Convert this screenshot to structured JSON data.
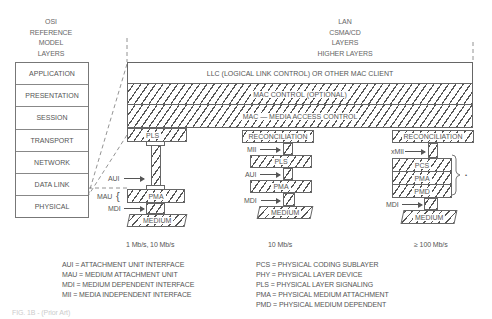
{
  "osi_header": [
    "OSI",
    "REFERENCE",
    "MODEL",
    "LAYERS"
  ],
  "lan_header": [
    "LAN",
    "CSMA/CD",
    "LAYERS",
    "HIGHER LAYERS"
  ],
  "osi_layers": [
    "APPLICATION",
    "PRESENTATION",
    "SESSION",
    "TRANSPORT",
    "NETWORK",
    "DATA LINK",
    "PHYSICAL"
  ],
  "lan_layers": {
    "llc": "LLC (LOGICAL LINK CONTROL) OR OTHER MAC CLIENT",
    "mac_control": "MAC CONTROL (OPTIONAL)",
    "mac": "MAC — MEDIA ACCESS CONTROL"
  },
  "stacks": [
    {
      "top": "PLS",
      "interfaces": {
        "aui": "AUI",
        "mau": "MAU",
        "mdi": "MDI"
      },
      "pma": "PMA",
      "medium": "MEDIUM",
      "speed": "1 Mb/s, 10 Mb/s"
    },
    {
      "top": "RECONCILIATION",
      "interfaces": {
        "mii": "MII",
        "aui": "AUI",
        "mdi": "MDI"
      },
      "pls": "PLS",
      "pma": "PMA",
      "medium": "MEDIUM",
      "speed": "10 Mb/s"
    },
    {
      "top": "RECONCILIATION",
      "interfaces": {
        "xmii": "xMII",
        "mdi": "MDI"
      },
      "pcs": "PCS",
      "pma": "PMA",
      "pmd": "PMD",
      "medium": "MEDIUM",
      "speed": "≥ 100 Mb/s",
      "brace_label": "PHY"
    }
  ],
  "legend_left": [
    "AUI = ATTACHMENT UNIT INTERFACE",
    "MAU = MEDIUM ATTACHMENT UNIT",
    "MDI = MEDIUM DEPENDENT INTERFACE",
    "MII = MEDIA INDEPENDENT INTERFACE"
  ],
  "legend_right": [
    "PCS = PHYSICAL CODING SUBLAYER",
    "PHY = PHYSICAL LAYER DEVICE",
    "PLS = PHYSICAL LAYER SIGNALING",
    "PMA = PHYSICAL MEDIUM ATTACHMENT",
    "PMD = PHYSICAL MEDIUM DEPENDENT"
  ],
  "caption": "FIG. 1B - (Prior Art)"
}
